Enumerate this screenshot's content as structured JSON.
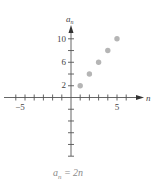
{
  "chart_data": {
    "type": "scatter",
    "title": "",
    "caption": "a_n = 2n",
    "xlabel": "n",
    "ylabel": "a_n",
    "x": [
      1,
      2,
      3,
      4,
      5
    ],
    "values": [
      2,
      4,
      6,
      8,
      10
    ],
    "series": [
      {
        "name": "a_n = 2n",
        "x": [
          1,
          2,
          3,
          4,
          5
        ],
        "values": [
          2,
          4,
          6,
          8,
          10
        ]
      }
    ],
    "xlim": [
      -7,
      7
    ],
    "ylim": [
      -10,
      12
    ],
    "x_ticks": [
      -6,
      -5,
      -4,
      -3,
      -2,
      -1,
      1,
      2,
      3,
      4,
      5,
      6
    ],
    "x_tick_labels": [
      "-5",
      "5"
    ],
    "y_ticks": [
      -10,
      -8,
      -6,
      -4,
      -2,
      2,
      4,
      6,
      8,
      10
    ],
    "y_tick_labels": [
      "2",
      "6",
      "10"
    ],
    "grid": false,
    "legend": null,
    "point_color": "#b5b5b5"
  },
  "labels": {
    "x_axis": "n",
    "y_axis_main": "a",
    "y_axis_sub": "n",
    "caption_main": "a",
    "caption_sub": "n",
    "caption_rest": " = 2n",
    "x_neg5": "−5",
    "x_pos5": "5",
    "y_2": "2",
    "y_6": "6",
    "y_10": "10"
  }
}
